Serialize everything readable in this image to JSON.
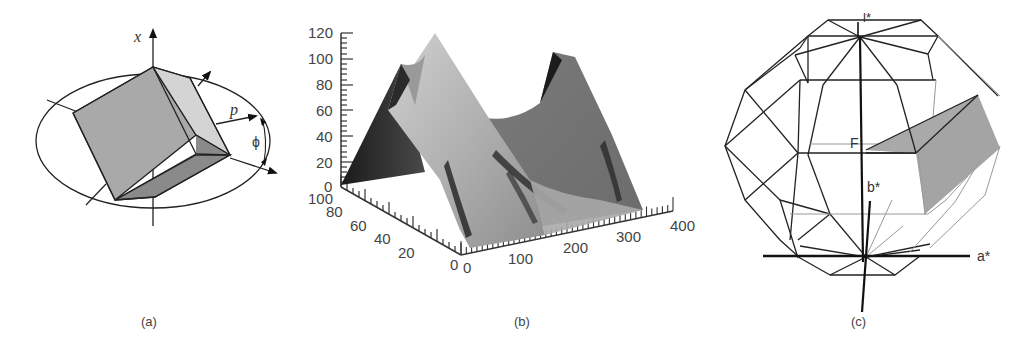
{
  "figure": {
    "panels": [
      {
        "id": "a",
        "caption": "(a)",
        "description": "Shaded cube tilted inside an ellipse with axes",
        "labels": {
          "axis_x": "x",
          "vector_p": "p",
          "angle_phi": "ϕ"
        }
      },
      {
        "id": "b",
        "caption": "(b)",
        "description": "3D shaded surface plot with two peaks"
      },
      {
        "id": "c",
        "caption": "(c)",
        "description": "Wireframe polyhedron with shaded sub-volume and reciprocal axes",
        "labels": {
          "top_axis": "l*",
          "point_F": "F",
          "axis_b": "b*",
          "axis_a": "a*"
        }
      }
    ]
  },
  "chart_data": {
    "type": "surface3d",
    "title": "",
    "z_axis": {
      "label": "",
      "ticks": [
        "0",
        "20",
        "40",
        "60",
        "80",
        "100",
        "120"
      ],
      "range": [
        0,
        120
      ]
    },
    "y_axis": {
      "label": "",
      "ticks": [
        "0",
        "20",
        "40",
        "60",
        "80",
        "100"
      ],
      "range": [
        0,
        100
      ]
    },
    "x_axis": {
      "label": "",
      "ticks": [
        "0",
        "100",
        "200",
        "300",
        "400"
      ],
      "range": [
        0,
        400
      ]
    },
    "peaks": [
      {
        "x": 60,
        "y": 90,
        "z": 120,
        "note": "tallest ridge peak near back-left"
      },
      {
        "x": 10,
        "y": 100,
        "z": 95,
        "note": "secondary cusp left"
      },
      {
        "x": 290,
        "y": 100,
        "z": 105,
        "note": "right peak"
      }
    ],
    "valley": {
      "x": 200,
      "y": 100,
      "z": 55
    },
    "grid": false,
    "shading": "grayscale"
  }
}
